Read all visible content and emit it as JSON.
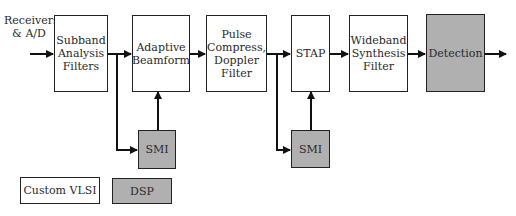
{
  "diagram": {
    "input_label": "Receivers\n& A/D",
    "blocks": [
      {
        "id": "subband",
        "label": "Subband\nAnalysis\nFilters",
        "type": "Custom VLSI"
      },
      {
        "id": "adaptive",
        "label": "Adaptive\nBeamform",
        "type": "Custom VLSI"
      },
      {
        "id": "pulse",
        "label": "Pulse\nCompress,\nDoppler\nFilter",
        "type": "Custom VLSI"
      },
      {
        "id": "stap",
        "label": "STAP",
        "type": "Custom VLSI"
      },
      {
        "id": "wideband",
        "label": "Wideband\nSynthesis\nFilter",
        "type": "Custom VLSI"
      },
      {
        "id": "detection",
        "label": "Detection",
        "type": "DSP"
      },
      {
        "id": "smi1",
        "label": "SMI",
        "type": "DSP"
      },
      {
        "id": "smi2",
        "label": "SMI",
        "type": "DSP"
      }
    ],
    "edges": [
      {
        "from": "input",
        "to": "subband"
      },
      {
        "from": "subband",
        "to": "adaptive"
      },
      {
        "from": "subband",
        "to": "smi1"
      },
      {
        "from": "smi1",
        "to": "adaptive"
      },
      {
        "from": "adaptive",
        "to": "pulse"
      },
      {
        "from": "pulse",
        "to": "stap"
      },
      {
        "from": "pulse",
        "to": "smi2"
      },
      {
        "from": "smi2",
        "to": "stap"
      },
      {
        "from": "stap",
        "to": "wideband"
      },
      {
        "from": "wideband",
        "to": "detection"
      },
      {
        "from": "detection",
        "to": "output"
      }
    ],
    "legend": [
      {
        "label": "Custom VLSI",
        "color": "#ffffff"
      },
      {
        "label": "DSP",
        "color": "#b0b0b0"
      }
    ]
  }
}
